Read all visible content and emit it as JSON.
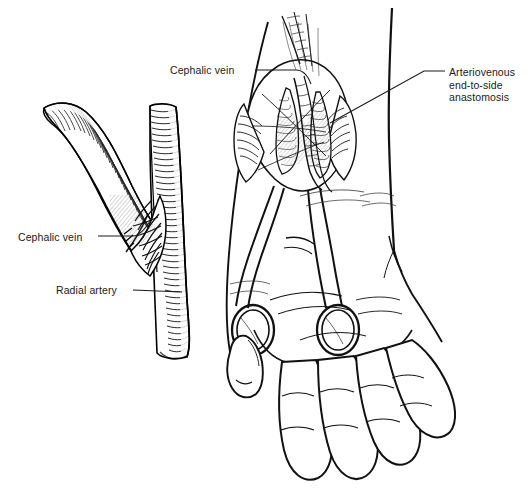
{
  "figure": {
    "title": "Arteriovenous fistula at the wrist: radial artery to cephalic vein end-to-side anastomosis",
    "style": "line-art medical illustration, black ink on white",
    "background_color": "#ffffff",
    "ink_color": "#000000",
    "label_text_color": "#1a1a1a",
    "width_px": 530,
    "height_px": 494
  },
  "labels": {
    "cephalic_vein_top": "Cephalic vein",
    "cephalic_vein_left": "Cephalic vein",
    "radial_artery": "Radial artery",
    "arteriovenous_anastomosis": "Arteriovenous\nend-to-side\nanastomosis"
  },
  "panels": {
    "left_detail": {
      "name": "vessel-anastomosis-detail",
      "description": "Magnified view of the cephalic vein sutured end-to-side onto the radial artery, both vessels rendered with fine cross-hatched shading lines",
      "parts": [
        "cephalic vein limb curving from upper-left down to the junction",
        "radial artery running vertically on the right",
        "row of suture stitches at the anastomosis"
      ]
    },
    "right_overview": {
      "name": "forearm-hand-overview",
      "description": "Volar view of the distal forearm, wrist and hand with an open surgical wound at the wrist held by retractors; two ring-handled instruments lie across the palm",
      "parts": [
        "forearm outline",
        "open wrist incision with retracted skin edges",
        "exposed radial artery and cephalic vein within the wound",
        "ring-handled retractor instruments",
        "thumb",
        "four fingers with flexion creases"
      ]
    }
  },
  "leader_lines": {
    "cephalic_vein_top": {
      "from": [
        255,
        70
      ],
      "to": [
        310,
        96
      ]
    },
    "cephalic_vein_left": {
      "from": [
        98,
        236
      ],
      "to": [
        152,
        218
      ]
    },
    "radial_artery": {
      "from": [
        133,
        290
      ],
      "to": [
        182,
        292
      ]
    },
    "arteriovenous_anastomosis": {
      "from": [
        445,
        71
      ],
      "to": [
        330,
        123
      ]
    }
  }
}
